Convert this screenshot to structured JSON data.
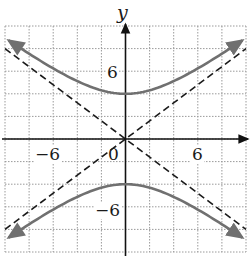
{
  "chart_data": {
    "type": "line",
    "title": "",
    "xlabel": "",
    "ylabel": "y",
    "xlim": [
      -10,
      10
    ],
    "ylim": [
      -10,
      10
    ],
    "grid": true,
    "grid_step": 2,
    "tick_labels": {
      "x": [
        "-6",
        "0",
        "6"
      ],
      "y": [
        "6",
        "-6"
      ]
    },
    "equation": "y^2/16 - x^2/25 = 1",
    "series": [
      {
        "name": "upper branch",
        "style": "solid",
        "color": "#707070",
        "x": [
          -10,
          -8,
          -6,
          -4,
          -2,
          0,
          2,
          4,
          6,
          8,
          10
        ],
        "y": [
          8.62,
          7.55,
          6.25,
          5.12,
          4.31,
          4,
          4.31,
          5.12,
          6.25,
          7.55,
          8.62
        ]
      },
      {
        "name": "lower branch",
        "style": "solid",
        "color": "#707070",
        "x": [
          -10,
          -8,
          -6,
          -4,
          -2,
          0,
          2,
          4,
          6,
          8,
          10
        ],
        "y": [
          -8.62,
          -7.55,
          -6.25,
          -5.12,
          -4.31,
          -4,
          -4.31,
          -5.12,
          -6.25,
          -7.55,
          -8.62
        ]
      },
      {
        "name": "asymptote y = 4/5 x",
        "style": "dashed",
        "color": "#1a1a1a",
        "x": [
          -10,
          10
        ],
        "y": [
          -8,
          8
        ]
      },
      {
        "name": "asymptote y = -4/5 x",
        "style": "dashed",
        "color": "#1a1a1a",
        "x": [
          -10,
          10
        ],
        "y": [
          8,
          -8
        ]
      }
    ]
  },
  "labels": {
    "y_axis": "y",
    "x_neg6": "−6",
    "x_zero": "0",
    "x_pos6": "6",
    "y_pos6": "6",
    "y_neg6": "−6"
  },
  "colors": {
    "curve": "#707070",
    "asymptote": "#1a1a1a",
    "grid": "#9a9a9a",
    "axis": "#111111"
  }
}
